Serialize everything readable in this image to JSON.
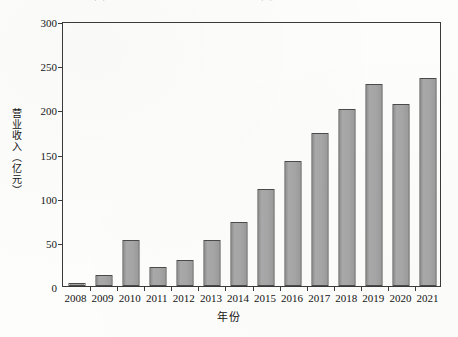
{
  "chart_data": {
    "type": "bar",
    "title": "图 1  2008—2021 年某出版发行集团营业收入发展情况",
    "title_note": "标题在图片顶部被裁切",
    "xlabel": "年份",
    "ylabel": "营业收入（亿元）",
    "categories": [
      "2008",
      "2009",
      "2010",
      "2011",
      "2012",
      "2013",
      "2014",
      "2015",
      "2016",
      "2017",
      "2018",
      "2019",
      "2020",
      "2021"
    ],
    "values": [
      3,
      13,
      52,
      21,
      30,
      52,
      72,
      110,
      141,
      173,
      200,
      229,
      206,
      236
    ],
    "ylim": [
      0,
      300
    ],
    "ytick_values": [
      0,
      50,
      100,
      150,
      200,
      250,
      300
    ],
    "ytick_labels": [
      "0",
      "50",
      "100",
      "150",
      "200",
      "250",
      "300"
    ],
    "grid": false,
    "legend": "none",
    "bar_fill_color": "#a5a5a5",
    "bar_border_color": "#4a4a4a",
    "axis_color": "#3a3a3a",
    "background_color": "#fdfdfb"
  }
}
